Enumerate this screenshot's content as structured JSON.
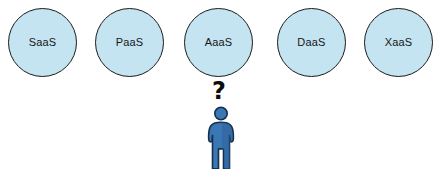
{
  "diagram": {
    "background_color": "#ffffff",
    "circle_fill_color": "#c5e4f1",
    "circle_stroke_color": "#1b1b1b",
    "person_body_color": "#3b76b5",
    "person_shade_color": "#2f629b",
    "person_outline_color": "#15304d",
    "nodes": [
      {
        "label": "SaaS",
        "x": 8
      },
      {
        "label": "PaaS",
        "x": 95
      },
      {
        "label": "AaaS",
        "x": 184
      },
      {
        "label": "DaaS",
        "x": 277
      },
      {
        "label": "XaaS",
        "x": 364
      }
    ],
    "thought": {
      "symbol": "?",
      "dot": "."
    },
    "person": {
      "icon_name": "person-pictogram"
    }
  }
}
